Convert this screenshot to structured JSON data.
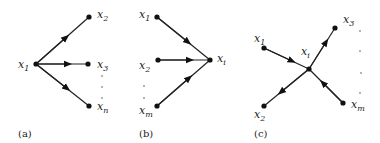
{
  "panels": [
    {
      "caption": "(a)",
      "description": "One-to-many: x1 points to x2, x3, ..., xn",
      "labels": {
        "center": {
          "base": "x",
          "sub": "1"
        },
        "n1": {
          "base": "x",
          "sub": "2"
        },
        "n2": {
          "base": "x",
          "sub": "3"
        },
        "n3": {
          "base": "x",
          "sub": "n"
        }
      }
    },
    {
      "caption": "(b)",
      "description": "Many-to-one: x1, x2, ..., xm point to xi",
      "labels": {
        "center": {
          "base": "x",
          "sub": "i"
        },
        "n1": {
          "base": "x",
          "sub": "1"
        },
        "n2": {
          "base": "x",
          "sub": "2"
        },
        "n3": {
          "base": "x",
          "sub": "m"
        }
      }
    },
    {
      "caption": "(c)",
      "description": "Mixed: x1 and xm point to xi; xi points to x2 and x3",
      "labels": {
        "center": {
          "base": "x",
          "sub": "i"
        },
        "n1": {
          "base": "x",
          "sub": "1"
        },
        "n2": {
          "base": "x",
          "sub": "2"
        },
        "n3": {
          "base": "x",
          "sub": "3"
        },
        "n4": {
          "base": "x",
          "sub": "m"
        }
      }
    }
  ]
}
